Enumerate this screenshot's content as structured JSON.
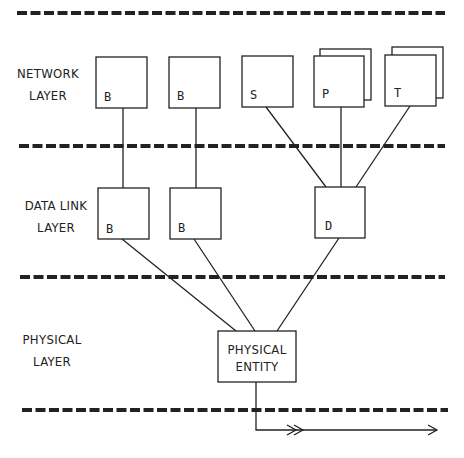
{
  "diagram": {
    "colors": {
      "ink": "#222222",
      "background": "#ffffff"
    },
    "layers": [
      {
        "id": "network",
        "label_line1": "NETWORK",
        "label_line2": "LAYER"
      },
      {
        "id": "datalink",
        "label_line1": "DATA LINK",
        "label_line2": "LAYER"
      },
      {
        "id": "physical",
        "label_line1": "PHYSICAL",
        "label_line2": "LAYER"
      }
    ],
    "network_entities": [
      {
        "id": "net-b1",
        "label": "B",
        "stacked": false
      },
      {
        "id": "net-b2",
        "label": "B",
        "stacked": false
      },
      {
        "id": "net-s",
        "label": "S",
        "stacked": false
      },
      {
        "id": "net-p",
        "label": "P",
        "stacked": true
      },
      {
        "id": "net-t",
        "label": "T",
        "stacked": true
      }
    ],
    "datalink_entities": [
      {
        "id": "dl-b1",
        "label": "B"
      },
      {
        "id": "dl-b2",
        "label": "B"
      },
      {
        "id": "dl-d",
        "label": "D"
      }
    ],
    "physical_entity": {
      "label_line1": "PHYSICAL",
      "label_line2": "ENTITY"
    },
    "connections": [
      {
        "from": "net-b1",
        "to": "dl-b1"
      },
      {
        "from": "net-b2",
        "to": "dl-b2"
      },
      {
        "from": "net-s",
        "to": "dl-d"
      },
      {
        "from": "net-p",
        "to": "dl-d"
      },
      {
        "from": "net-t",
        "to": "dl-d"
      },
      {
        "from": "dl-b1",
        "to": "physical-entity"
      },
      {
        "from": "dl-b2",
        "to": "physical-entity"
      },
      {
        "from": "dl-d",
        "to": "physical-entity"
      },
      {
        "from": "physical-entity",
        "to": "medium",
        "arrow": "double-arrow-right"
      }
    ]
  }
}
